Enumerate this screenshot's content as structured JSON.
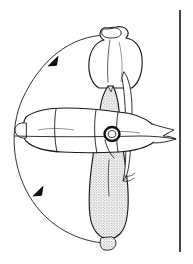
{
  "figure": {
    "kind": "scientific-line-drawing",
    "background_color": "#ffffff",
    "ink_color": "#1a1a1a",
    "stipple_color": "#555555",
    "width_px": 193,
    "height_px": 264,
    "caption": "",
    "labels": []
  },
  "elements": {
    "horizontal_body": {
      "name": "horizontal-segmented-body",
      "description": "Elongated horizontal body with segment creases, rounded knob at left end and forked pointed tip at right end",
      "fill": "#ffffff",
      "outline": "#1a1a1a"
    },
    "upper_lobe": {
      "name": "upper-lobe",
      "description": "Rounded upper lobe with small apical knob at top",
      "fill": "#ffffff",
      "outline": "#1a1a1a"
    },
    "stippled_organ": {
      "name": "stippled-vertical-organ",
      "description": "Vertical elongated stippled organ running from upper lobe down to a small terminal knob",
      "fill": "stipple",
      "outline": "#1a1a1a"
    },
    "ring_marker": {
      "name": "ring-marker",
      "description": "Small dark ring at the crossing point of the two bodies",
      "fill": "#111111"
    },
    "rotation_arc": {
      "name": "rotation-arc",
      "description": "Large open curved arc on the left with two arrowheads indicating direction of movement",
      "arrow_count": 2,
      "direction": "counterclockwise"
    },
    "scale_bar": {
      "name": "scale-bar",
      "description": "Plain vertical scale bar at the right margin",
      "orientation": "vertical",
      "value_text": ""
    }
  }
}
